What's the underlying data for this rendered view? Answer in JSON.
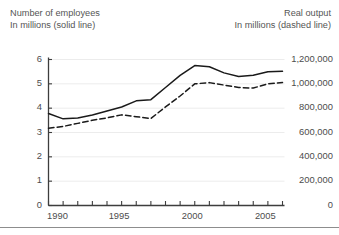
{
  "header": {
    "left_title": "Number of employees",
    "left_subtitle": "In millions (solid line)",
    "right_title": "Real output",
    "right_subtitle": "In millions (dashed line)"
  },
  "colors": {
    "line": "#1a1a1a",
    "gridline": "#ececec",
    "axis": "#3d3d3d",
    "text": "#4d4d4d",
    "header_text": "#555555",
    "footer_rule": "#8d8d8d",
    "background": "#ffffff"
  },
  "chart_data": {
    "type": "line",
    "title": "",
    "subtitle": "",
    "xlabel": "",
    "ylabel": "In millions",
    "grid": true,
    "legend_position": "above-plot-as-axis-captions",
    "x_axis": {
      "label": "",
      "min": 1990,
      "max": 2006,
      "tick_interval": 1,
      "labeled_ticks": [
        1990,
        1995,
        2000,
        2005
      ],
      "tick_labels": [
        "1990",
        "1995",
        "2000",
        "2005"
      ]
    },
    "y_axis_left": {
      "label": "Number of employees, In millions (solid line)",
      "min": 0,
      "max": 6,
      "tick_interval": 1,
      "tick_labels": [
        "0",
        "1",
        "2",
        "3",
        "4",
        "5",
        "6"
      ],
      "ticks": [
        0,
        1,
        2,
        3,
        4,
        5,
        6
      ]
    },
    "y_axis_right": {
      "label": "Real output, In millions (dashed line)",
      "min": 0,
      "max": 1200000,
      "tick_interval": 200000,
      "tick_labels": [
        "0",
        "200,000",
        "400,000",
        "600,000",
        "800,000",
        "1,000,000",
        "1,200,000"
      ],
      "ticks": [
        0,
        200000,
        400000,
        600000,
        800000,
        1000000,
        1200000
      ]
    },
    "x": [
      1990,
      1991,
      1992,
      1993,
      1994,
      1995,
      1996,
      1997,
      1998,
      1999,
      2000,
      2001,
      2002,
      2003,
      2004,
      2005,
      2006
    ],
    "series": [
      {
        "name": "Number of employees",
        "style": "solid",
        "axis": "left",
        "units": "millions",
        "values": [
          3.78,
          3.56,
          3.6,
          3.72,
          3.88,
          4.05,
          4.3,
          4.35,
          4.85,
          5.35,
          5.75,
          5.7,
          5.45,
          5.3,
          5.35,
          5.5,
          5.52
        ]
      },
      {
        "name": "Real output",
        "style": "dashed",
        "axis": "right",
        "units": "millions",
        "values": [
          635000,
          650000,
          675000,
          700000,
          720000,
          745000,
          730000,
          715000,
          810000,
          900000,
          1000000,
          1010000,
          990000,
          970000,
          965000,
          1000000,
          1010000
        ]
      }
    ]
  }
}
